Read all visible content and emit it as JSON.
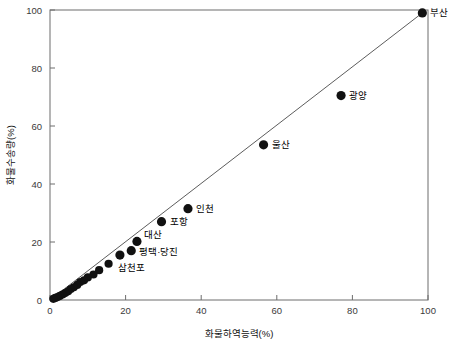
{
  "chart_data": {
    "type": "scatter",
    "title": "",
    "xlabel": "화물하역능력(%)",
    "ylabel": "화물수송량(%)",
    "xlim": [
      0,
      100
    ],
    "ylim": [
      0,
      100
    ],
    "xticks": [
      0,
      20,
      40,
      60,
      80,
      100
    ],
    "yticks": [
      0,
      20,
      40,
      60,
      80,
      100
    ],
    "grid": false,
    "legend": null,
    "reference_line": {
      "description": "diagonal fit line from origin to top-right point",
      "x": [
        0,
        98.5
      ],
      "y": [
        0,
        99
      ]
    },
    "points": [
      {
        "label": "부산",
        "x": 98.5,
        "y": 99
      },
      {
        "label": "광양",
        "x": 77,
        "y": 70.5
      },
      {
        "label": "울산",
        "x": 56.5,
        "y": 53.5
      },
      {
        "label": "인천",
        "x": 36.5,
        "y": 31.5
      },
      {
        "label": "포항",
        "x": 29.5,
        "y": 27
      },
      {
        "label": "대산",
        "x": 23,
        "y": 20.2
      },
      {
        "label": "평택·당진",
        "x": 21.5,
        "y": 17
      },
      {
        "label": "삼천포",
        "x": 18.5,
        "y": 15.5
      },
      {
        "label": "",
        "x": 15.5,
        "y": 12.5
      },
      {
        "label": "",
        "x": 13,
        "y": 10.3
      },
      {
        "label": "",
        "x": 11.5,
        "y": 8.8
      },
      {
        "label": "",
        "x": 10,
        "y": 7.8
      },
      {
        "label": "",
        "x": 9,
        "y": 6.8
      },
      {
        "label": "",
        "x": 8,
        "y": 6.2
      },
      {
        "label": "",
        "x": 7.2,
        "y": 5.2
      },
      {
        "label": "",
        "x": 6.3,
        "y": 4.4
      },
      {
        "label": "",
        "x": 5.5,
        "y": 3.8
      },
      {
        "label": "",
        "x": 4.8,
        "y": 3.0
      },
      {
        "label": "",
        "x": 4.0,
        "y": 2.4
      },
      {
        "label": "",
        "x": 3.3,
        "y": 1.9
      },
      {
        "label": "",
        "x": 2.6,
        "y": 1.4
      },
      {
        "label": "",
        "x": 2.0,
        "y": 1.0
      },
      {
        "label": "",
        "x": 1.4,
        "y": 0.7
      },
      {
        "label": "",
        "x": 0.9,
        "y": 0.4
      }
    ],
    "point_labels": {
      "busan": "부산",
      "gwangyang": "광양",
      "ulsan": "울산",
      "incheon": "인천",
      "pohang": "포항",
      "daesan": "대산",
      "pyeongtaek_dangjin": "평택·당진",
      "samcheonpo": "삼천포"
    },
    "axis_tick_text": {
      "x": [
        "0",
        "20",
        "40",
        "60",
        "80",
        "100"
      ],
      "y": [
        "0",
        "20",
        "40",
        "60",
        "80",
        "100"
      ]
    },
    "colors": {
      "marker": "#111111",
      "line": "#4a4a4a",
      "frame": "#6d6d6d",
      "background": "#ffffff",
      "text": "#111111"
    }
  }
}
